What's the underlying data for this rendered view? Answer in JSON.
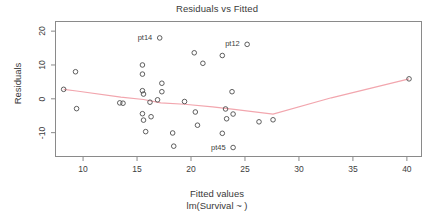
{
  "chart_data": {
    "type": "scatter",
    "title": "Residuals vs Fitted",
    "xlabel": "Fitted values",
    "sublabel": "lm(Survival ~  )",
    "ylabel": "Residuals",
    "xlim": [
      7.4,
      41.4
    ],
    "ylim": [
      -17.2,
      23.0
    ],
    "xticks": [
      10,
      15,
      20,
      25,
      30,
      35,
      40
    ],
    "yticks": [
      20,
      10,
      0,
      -10
    ],
    "grid": false,
    "legend": null,
    "point_color": "#4d4d4d",
    "smoother_color": "#f2a6ae",
    "frame_color": "#8a8a8a",
    "points": [
      {
        "x": 8.2,
        "y": 2.8
      },
      {
        "x": 9.3,
        "y": 8.0
      },
      {
        "x": 9.4,
        "y": -2.9
      },
      {
        "x": 13.4,
        "y": -1.2
      },
      {
        "x": 13.7,
        "y": -1.3
      },
      {
        "x": 15.5,
        "y": 10.0
      },
      {
        "x": 15.5,
        "y": 7.3
      },
      {
        "x": 15.5,
        "y": 2.4
      },
      {
        "x": 15.6,
        "y": 1.4
      },
      {
        "x": 15.5,
        "y": -4.4
      },
      {
        "x": 15.6,
        "y": -6.3
      },
      {
        "x": 15.8,
        "y": -9.7
      },
      {
        "x": 16.2,
        "y": -1.0
      },
      {
        "x": 16.3,
        "y": -5.3
      },
      {
        "x": 16.9,
        "y": -0.3
      },
      {
        "x": 17.1,
        "y": 18.0
      },
      {
        "x": 17.3,
        "y": 4.6
      },
      {
        "x": 17.3,
        "y": 2.1
      },
      {
        "x": 18.3,
        "y": -10.1
      },
      {
        "x": 18.4,
        "y": -14.0
      },
      {
        "x": 19.4,
        "y": -0.8
      },
      {
        "x": 20.3,
        "y": 13.6
      },
      {
        "x": 20.4,
        "y": -3.9
      },
      {
        "x": 20.6,
        "y": -7.8
      },
      {
        "x": 21.1,
        "y": 10.5
      },
      {
        "x": 22.9,
        "y": 12.8
      },
      {
        "x": 22.9,
        "y": -10.2
      },
      {
        "x": 23.2,
        "y": -3.0
      },
      {
        "x": 23.3,
        "y": -5.9
      },
      {
        "x": 23.8,
        "y": 2.1
      },
      {
        "x": 23.9,
        "y": -4.5
      },
      {
        "x": 23.9,
        "y": -14.4
      },
      {
        "x": 25.2,
        "y": 16.1
      },
      {
        "x": 26.3,
        "y": -6.8
      },
      {
        "x": 27.6,
        "y": -6.2
      },
      {
        "x": 40.2,
        "y": 5.9
      }
    ],
    "annotations": [
      {
        "label": "pt14",
        "x": 17.1,
        "y": 18.0,
        "side": "left"
      },
      {
        "label": "pt12",
        "x": 25.2,
        "y": 16.1,
        "side": "left"
      },
      {
        "label": "pt45",
        "x": 23.9,
        "y": -14.4,
        "side": "left"
      }
    ],
    "smoother": [
      {
        "x": 8.2,
        "y": 2.8
      },
      {
        "x": 9.4,
        "y": 2.3
      },
      {
        "x": 13.5,
        "y": 0.5
      },
      {
        "x": 15.6,
        "y": -0.2
      },
      {
        "x": 17.2,
        "y": -1.2
      },
      {
        "x": 19.4,
        "y": -1.6
      },
      {
        "x": 22.0,
        "y": -2.4
      },
      {
        "x": 24.0,
        "y": -3.1
      },
      {
        "x": 27.6,
        "y": -4.5
      },
      {
        "x": 33.0,
        "y": 0.3
      },
      {
        "x": 40.2,
        "y": 5.9
      }
    ]
  }
}
